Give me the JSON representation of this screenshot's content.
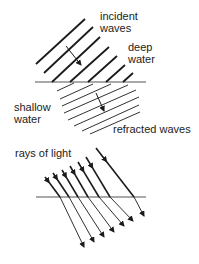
{
  "labels": {
    "incident_waves": [
      "incident",
      "waves"
    ],
    "deep_water": [
      "deep",
      "water"
    ],
    "shallow_water": [
      "shallow",
      "water"
    ],
    "refracted_waves": "refracted waves",
    "rays_of_light": "rays of light"
  },
  "colors": {
    "line": "#1a1a1a",
    "boundary": "#555555",
    "text": "#222222"
  },
  "wave_diagram": {
    "boundary": {
      "x1": 35,
      "y1": 82,
      "x2": 146,
      "y2": 82
    },
    "incident_wavefronts": [
      [
        36,
        64,
        85,
        19
      ],
      [
        44,
        73,
        93,
        27
      ],
      [
        52,
        82,
        100,
        37
      ],
      [
        70,
        82,
        109,
        47
      ],
      [
        88,
        82,
        117,
        56
      ],
      [
        106,
        82,
        125,
        65
      ],
      [
        123,
        82,
        133,
        73
      ]
    ],
    "refracted_wavefronts": [
      [
        57,
        91,
        74,
        83
      ],
      [
        60,
        99,
        93,
        84
      ],
      [
        62,
        106,
        111,
        84
      ],
      [
        64,
        113,
        128,
        85
      ],
      [
        68,
        120,
        136,
        90
      ],
      [
        74,
        126,
        139,
        97
      ],
      [
        82,
        131,
        139,
        105
      ],
      [
        90,
        134,
        140,
        112
      ]
    ],
    "deep_arrow": {
      "x1": 66,
      "y1": 46,
      "x2": 81,
      "y2": 65
    },
    "shallow_arrow": {
      "x1": 96,
      "y1": 93,
      "x2": 104,
      "y2": 111
    }
  },
  "light_diagram": {
    "boundary": {
      "x1": 36,
      "y1": 197,
      "x2": 146,
      "y2": 197
    },
    "rays": [
      {
        "start": [
          45,
          177
        ],
        "cross": [
          60,
          197
        ],
        "end": [
          84,
          247
        ]
      },
      {
        "start": [
          53,
          173
        ],
        "cross": [
          69,
          197
        ],
        "end": [
          94,
          242
        ]
      },
      {
        "start": [
          62,
          170
        ],
        "cross": [
          78,
          197
        ],
        "end": [
          104,
          237
        ]
      },
      {
        "start": [
          70,
          166
        ],
        "cross": [
          88,
          197
        ],
        "end": [
          114,
          232
        ]
      },
      {
        "start": [
          78,
          162
        ],
        "cross": [
          99,
          197
        ],
        "end": [
          124,
          226
        ]
      },
      {
        "start": [
          86,
          157
        ],
        "cross": [
          110,
          197
        ],
        "end": [
          133,
          221
        ]
      },
      {
        "start": [
          96,
          148
        ],
        "cross": [
          134,
          197
        ],
        "end": [
          144,
          216
        ]
      }
    ]
  }
}
